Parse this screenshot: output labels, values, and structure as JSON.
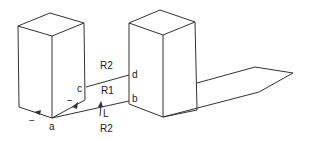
{
  "diagram": {
    "labels": {
      "a": "a",
      "b": "b",
      "c": "c",
      "d": "d",
      "r2_top": "R2",
      "r1": "R1",
      "l": "L",
      "r2_bottom": "R2",
      "minus_left": "−",
      "minus_right": "−"
    },
    "colors": {
      "stroke": "#333333",
      "background": "#ffffff"
    }
  }
}
